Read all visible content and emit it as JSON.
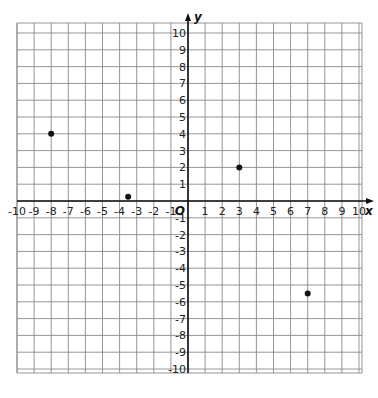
{
  "chart_data": {
    "type": "scatter",
    "title": "",
    "xlabel": "x",
    "ylabel": "y",
    "origin_label": "O",
    "xlim": [
      -10,
      10
    ],
    "ylim": [
      -10,
      10
    ],
    "grid": true,
    "x_ticks": [
      -10,
      -9,
      -8,
      -7,
      -6,
      -5,
      -4,
      -3,
      -2,
      -1,
      1,
      2,
      3,
      4,
      5,
      6,
      7,
      8,
      9,
      10
    ],
    "y_ticks": [
      -10,
      -9,
      -8,
      -7,
      -6,
      -5,
      -4,
      -3,
      -2,
      -1,
      1,
      2,
      3,
      4,
      5,
      6,
      7,
      8,
      9,
      10
    ],
    "series": [
      {
        "name": "points",
        "points": [
          {
            "x": -8,
            "y": 4
          },
          {
            "x": -3.5,
            "y": 0.25
          },
          {
            "x": 3,
            "y": 2
          },
          {
            "x": 7,
            "y": -5.5
          }
        ]
      }
    ],
    "legend": null
  },
  "colors": {
    "grid": "#8a8a8a",
    "axis": "#111111",
    "point": "#111111"
  }
}
